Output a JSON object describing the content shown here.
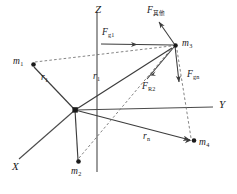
{
  "figure": {
    "type": "physics-vector-diagram",
    "title_caption": "",
    "background_color": "#ffffff",
    "line_color": "#3c3c3c",
    "dashed_color": "#707070",
    "text_color": "#1a1a1a",
    "width": 237,
    "height": 194
  },
  "axes": [
    {
      "id": "x",
      "label": "X",
      "x": 12,
      "y": 166
    },
    {
      "id": "y",
      "label": "Y",
      "x": 219,
      "y": 104
    },
    {
      "id": "z",
      "label": "Z",
      "x": 96,
      "y": 8
    }
  ],
  "origin": {
    "x": 75,
    "y": 110,
    "label": "O"
  },
  "masses": [
    {
      "id": "m1",
      "label": "m",
      "sub": "1",
      "px": 31,
      "py": 64,
      "label_x": 13,
      "label_y": 58
    },
    {
      "id": "m2",
      "label": "m",
      "sub": "2",
      "px": 78,
      "py": 163,
      "label_x": 71,
      "label_y": 169
    },
    {
      "id": "m3",
      "label": "m",
      "sub": "3",
      "px": 175,
      "py": 46,
      "label_x": 183,
      "label_y": 41
    },
    {
      "id": "m4",
      "label": "m",
      "sub": "4",
      "px": 194,
      "py": 141,
      "label_x": 199,
      "label_y": 140
    }
  ],
  "forces": [
    {
      "id": "f-qita",
      "label": "F",
      "sub": "其他",
      "sub_is_cjk": true,
      "label_x": 148,
      "label_y": 9,
      "from_x": 175,
      "from_y": 46,
      "to_x": 159,
      "to_y": 22
    },
    {
      "id": "f-g1",
      "label": "F",
      "sub": "g1",
      "sub_is_cjk": false,
      "label_x": 102,
      "label_y": 31,
      "from_x": 175,
      "from_y": 46,
      "to_x": 102,
      "to_y": 45
    },
    {
      "id": "f-gn",
      "label": "F",
      "sub": "gn",
      "sub_is_cjk": false,
      "label_x": 190,
      "label_y": 73,
      "from_x": 175,
      "from_y": 46,
      "to_x": 180,
      "to_y": 83
    },
    {
      "id": "f-r2",
      "label": "F",
      "sub": "R2",
      "sub_is_cjk": false,
      "label_x": 144,
      "label_y": 85,
      "from_x": 175,
      "from_y": 46,
      "to_x": 146,
      "to_y": 78
    }
  ],
  "radii": [
    {
      "id": "r1-left",
      "label": "r",
      "sub": "1",
      "label_x": 42,
      "label_y": 76
    },
    {
      "id": "r1-mid",
      "label": "r",
      "sub": "1",
      "label_x": 94,
      "label_y": 75
    },
    {
      "id": "rn",
      "label": "r",
      "sub": "n",
      "label_x": 144,
      "label_y": 135
    }
  ],
  "segments": {
    "solid": [
      {
        "name": "axis-z",
        "x1": 97,
        "y1": 12,
        "x2": 97,
        "y2": 172
      },
      {
        "name": "axis-y",
        "x1": 75,
        "y1": 110,
        "x2": 214,
        "y2": 107
      },
      {
        "name": "axis-x",
        "x1": 75,
        "y1": 110,
        "x2": 18,
        "y2": 160
      },
      {
        "name": "origin-to-m1",
        "x1": 75,
        "y1": 110,
        "x2": 33,
        "y2": 66
      },
      {
        "name": "origin-to-m2",
        "x1": 75,
        "y1": 110,
        "x2": 78,
        "y2": 161
      },
      {
        "name": "origin-to-m3",
        "x1": 75,
        "y1": 110,
        "x2": 173,
        "y2": 48
      },
      {
        "name": "origin-to-m4",
        "x1": 75,
        "y1": 110,
        "x2": 192,
        "y2": 141
      }
    ],
    "dashed": [
      {
        "name": "m1-to-m3-dashed",
        "x1": 34,
        "y1": 62,
        "x2": 172,
        "y2": 46
      },
      {
        "name": "m2-to-m3-dashed",
        "x1": 79,
        "y1": 159,
        "x2": 173,
        "y2": 48
      },
      {
        "name": "m3-to-m4-dashed",
        "x1": 178,
        "y1": 49,
        "x2": 193,
        "y2": 139
      }
    ]
  }
}
